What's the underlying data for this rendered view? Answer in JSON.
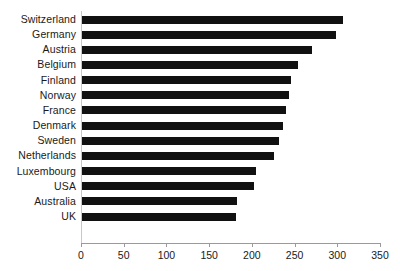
{
  "chart_data": {
    "type": "bar",
    "orientation": "horizontal",
    "title": "",
    "subtitle": "",
    "xlabel": "",
    "ylabel": "",
    "xlim": [
      0,
      350
    ],
    "xticks": [
      0,
      50,
      100,
      150,
      200,
      250,
      300,
      350
    ],
    "grid": false,
    "legend": null,
    "bar_color": "#111111",
    "axis_color": "#9a9a9a",
    "categories": [
      "Switzerland",
      "Germany",
      "Austria",
      "Belgium",
      "Finland",
      "Norway",
      "France",
      "Denmark",
      "Sweden",
      "Netherlands",
      "Luxembourg",
      "USA",
      "Australia",
      "UK"
    ],
    "values": [
      307,
      298,
      270,
      254,
      246,
      243,
      240,
      236,
      232,
      226,
      205,
      202,
      183,
      181
    ]
  }
}
